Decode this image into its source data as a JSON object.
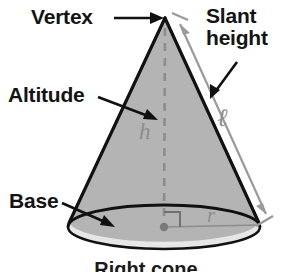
{
  "figure": {
    "caption": "Right cone",
    "shape": "cone",
    "colors": {
      "cone_body_fill": "#b4b4b4",
      "base_ellipse_fill": "#e6e6e6",
      "outline": "#111111",
      "measure_line": "#9a9a9a",
      "math_symbol": "#8d8d8d",
      "label_text": "#141414",
      "background": "#ffffff"
    }
  },
  "labels": {
    "vertex": "Vertex",
    "slant_height_line1": "Slant",
    "slant_height_line2": "height",
    "altitude": "Altitude",
    "base": "Base"
  },
  "symbols": {
    "height": "h",
    "radius": "r",
    "slant": "ℓ"
  },
  "geometry": {
    "apex_x": 165,
    "apex_y": 18,
    "base_center_x": 164,
    "base_center_y": 227,
    "base_rx": 96,
    "base_ry": 22,
    "right_angle_marker": true,
    "center_dot": true,
    "altitude_dashed": true
  }
}
